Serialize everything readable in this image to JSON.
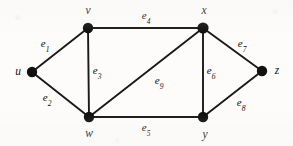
{
  "figure": {
    "kind": "undirected-graph-diagram",
    "width": 293,
    "height": 146,
    "background_color": "#fdfcfb",
    "ink_color": "#111111"
  },
  "vertices": [
    {
      "id": "u",
      "label": "u",
      "x": 32,
      "y": 72,
      "label_x": 18,
      "label_y": 72,
      "radius": 5.2
    },
    {
      "id": "v",
      "label": "v",
      "x": 88,
      "y": 28,
      "label_x": 88,
      "label_y": 11,
      "radius": 5.2
    },
    {
      "id": "w",
      "label": "w",
      "x": 89,
      "y": 117,
      "label_x": 89,
      "label_y": 134,
      "radius": 5.2
    },
    {
      "id": "x",
      "label": "x",
      "x": 203,
      "y": 28,
      "label_x": 204,
      "label_y": 11,
      "radius": 5.6
    },
    {
      "id": "y",
      "label": "y",
      "x": 203,
      "y": 117,
      "label_x": 205,
      "label_y": 135,
      "radius": 5.2
    },
    {
      "id": "z",
      "label": "z",
      "x": 262,
      "y": 71,
      "label_x": 277,
      "label_y": 71,
      "radius": 5.2
    }
  ],
  "edges": [
    {
      "id": "e1",
      "label": "e",
      "subscript": "1",
      "from": "u",
      "to": "v",
      "label_x": 45,
      "label_y": 45
    },
    {
      "id": "e2",
      "label": "e",
      "subscript": "2",
      "from": "u",
      "to": "w",
      "label_x": 47,
      "label_y": 99
    },
    {
      "id": "e3",
      "label": "e",
      "subscript": "3",
      "from": "v",
      "to": "w",
      "label_x": 97,
      "label_y": 72
    },
    {
      "id": "e4",
      "label": "e",
      "subscript": "4",
      "from": "v",
      "to": "x",
      "label_x": 146,
      "label_y": 17
    },
    {
      "id": "e5",
      "label": "e",
      "subscript": "5",
      "from": "w",
      "to": "y",
      "label_x": 146,
      "label_y": 129
    },
    {
      "id": "e6",
      "label": "e",
      "subscript": "6",
      "from": "x",
      "to": "y",
      "label_x": 211,
      "label_y": 72
    },
    {
      "id": "e7",
      "label": "e",
      "subscript": "7",
      "from": "x",
      "to": "z",
      "label_x": 242,
      "label_y": 45
    },
    {
      "id": "e8",
      "label": "e",
      "subscript": "8",
      "from": "y",
      "to": "z",
      "label_x": 241,
      "label_y": 104
    },
    {
      "id": "e9",
      "label": "e",
      "subscript": "9",
      "from": "w",
      "to": "x",
      "label_x": 159,
      "label_y": 82
    }
  ]
}
